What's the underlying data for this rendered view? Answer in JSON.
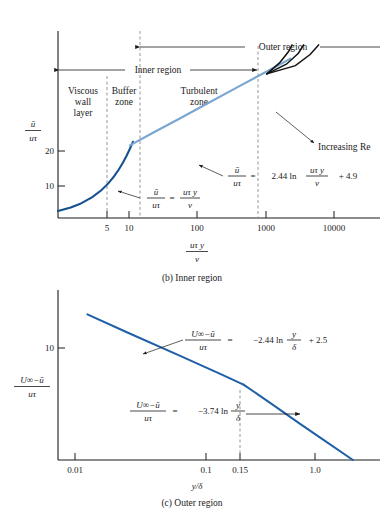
{
  "figure": {
    "background": "#ffffff"
  },
  "colors": {
    "log_law_line": "#7aa6d2",
    "viscous_line": "#16518f",
    "re_curves": "#111111",
    "outer_line": "#1f5fa6",
    "axis": "#1a1a1a",
    "dashed_guide": "#8a8a8a"
  },
  "panel_b": {
    "caption": "(b) Inner region",
    "ylabel_num": "ū",
    "ylabel_den": "uτ",
    "xlabel_num": "uτ y",
    "xlabel_den": "ν",
    "y_ticks": [
      "20",
      "10"
    ],
    "x_ticks": [
      "5",
      "10",
      "100",
      "1000",
      "10000"
    ],
    "zones": [
      {
        "id": "viscous-wall-layer",
        "lines": [
          "Viscous",
          "wall",
          "layer"
        ]
      },
      {
        "id": "buffer-zone",
        "lines": [
          "Buffer",
          "zone"
        ]
      },
      {
        "id": "turbulent-zone",
        "lines": [
          "Turbulent",
          "zone"
        ]
      }
    ],
    "regions": [
      {
        "id": "outer-region",
        "label": "Outer region"
      },
      {
        "id": "inner-region",
        "label": "Inner region"
      }
    ],
    "annotations": [
      {
        "id": "increasing-re",
        "label": "Increasing Re"
      }
    ],
    "equations": {
      "viscous": {
        "lhs_num": "ū",
        "lhs_den": "uτ",
        "eq": "=",
        "rhs_num": "uτ y",
        "rhs_den": "ν"
      },
      "log_law": {
        "lhs_num": "ū",
        "lhs_den": "uτ",
        "eq": "=",
        "coef": "2.44 ln",
        "arg_num": "uτ y",
        "arg_den": "ν",
        "const": "+ 4.9"
      }
    }
  },
  "panel_c": {
    "caption": "(c) Outer region",
    "ylabel_num": "U∞−ū",
    "ylabel_den": "uτ",
    "xlabel": "y/δ",
    "y_ticks": [
      "10"
    ],
    "x_ticks": [
      "0.01",
      "0.1",
      "0.15",
      "1.0"
    ],
    "equations": {
      "defect_log": {
        "lhs_num": "U∞−ū",
        "lhs_den": "uτ",
        "eq": "=",
        "coef": "−2.44 ln",
        "arg_num": "y",
        "arg_den": "δ",
        "const": "+ 2.5"
      },
      "defect_wake": {
        "lhs_num": "U∞−ū",
        "lhs_den": "uτ",
        "eq": "=",
        "coef": "−3.74 ln",
        "arg_num": "y",
        "arg_den": "δ"
      }
    }
  },
  "chart_data": [
    {
      "id": "inner-region-chart",
      "type": "line",
      "title": "(b) Inner region",
      "xlabel": "uτ y / ν",
      "ylabel": "ū / uτ",
      "xscale": "log",
      "xlim": [
        1,
        30000
      ],
      "ylim": [
        0,
        27
      ],
      "xticks": [
        5,
        10,
        100,
        1000,
        10000
      ],
      "xticklabels": [
        "5",
        "10",
        "100",
        "1000",
        "10000"
      ],
      "yticks": [
        10,
        20
      ],
      "yticklabels": [
        "10",
        "20"
      ],
      "grid": false,
      "legend": false,
      "zone_boundaries": [
        {
          "label": "viscous/buffer",
          "x": 5
        },
        {
          "label": "buffer/turbulent",
          "x": 30
        },
        {
          "label": "inner/outer",
          "x": 800
        }
      ],
      "series": [
        {
          "name": "Viscous sublayer: ū/uτ = uτy/ν",
          "color": "#16518f",
          "x": [
            1,
            1.5,
            2,
            3,
            4,
            5,
            6,
            7,
            8,
            9,
            10,
            11
          ],
          "y": [
            1,
            1.5,
            2,
            3,
            4,
            5,
            6,
            7,
            8,
            9,
            10,
            11
          ]
        },
        {
          "name": "Log law: ū/uτ = 2.44 ln(uτy/ν) + 4.9",
          "color": "#7aa6d2",
          "x": [
            10,
            20,
            50,
            100,
            300,
            1000,
            1500,
            1700
          ],
          "y": [
            10.5,
            12.2,
            14.4,
            16.1,
            18.8,
            21.7,
            22.7,
            23.0
          ]
        },
        {
          "name": "Wake, low Re",
          "color": "#111111",
          "x": [
            800,
            1200,
            1600,
            1800
          ],
          "y": [
            20.8,
            22.4,
            24.0,
            25.0
          ]
        },
        {
          "name": "Wake, medium Re",
          "color": "#111111",
          "x": [
            800,
            1500,
            2200,
            2600
          ],
          "y": [
            20.8,
            22.2,
            23.8,
            25.0
          ]
        },
        {
          "name": "Wake, high Re",
          "color": "#111111",
          "x": [
            800,
            2000,
            3200,
            4200
          ],
          "y": [
            20.8,
            22.0,
            23.6,
            25.0
          ]
        }
      ]
    },
    {
      "id": "outer-region-chart",
      "type": "line",
      "title": "(c) Outer region",
      "xlabel": "y/δ",
      "ylabel": "(U∞−ū)/uτ",
      "xscale": "log",
      "xlim": [
        0.006,
        1.6
      ],
      "ylim": [
        0,
        16
      ],
      "xticks": [
        0.01,
        0.1,
        0.15,
        1.0
      ],
      "xticklabels": [
        "0.01",
        "0.1",
        "0.15",
        "1.0"
      ],
      "yticks": [
        10
      ],
      "yticklabels": [
        "10"
      ],
      "grid": false,
      "legend": false,
      "zone_boundaries": [
        {
          "label": "log/wake break",
          "x": 0.15
        }
      ],
      "series": [
        {
          "name": "Defect law: (U∞−ū)/uτ = −2.44 ln(y/δ) + 2.5",
          "color": "#1f5fa6",
          "x": [
            0.01,
            0.02,
            0.05,
            0.1,
            0.15
          ],
          "y": [
            13.7,
            12.0,
            9.8,
            8.1,
            7.1
          ]
        },
        {
          "name": "Wake region: (U∞−ū)/uτ = −3.74 ln(y/δ)",
          "color": "#1f5fa6",
          "x": [
            0.15,
            0.25,
            0.4,
            0.6,
            1.0
          ],
          "y": [
            7.1,
            5.2,
            3.4,
            1.9,
            0.0
          ]
        }
      ]
    }
  ]
}
